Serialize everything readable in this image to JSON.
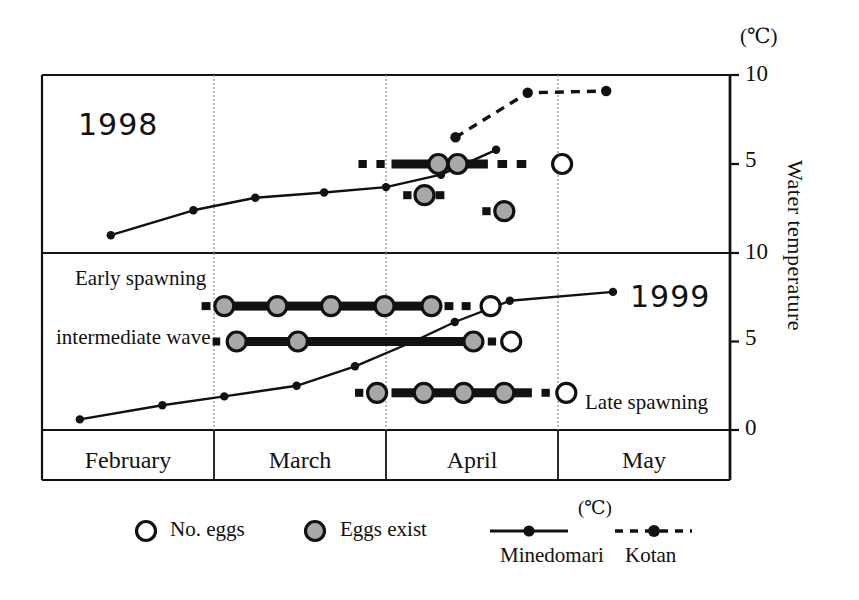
{
  "axis": {
    "unit_top": "(℃)",
    "title": "Water temperature",
    "top_panel_ticks": [
      "10",
      "5"
    ],
    "bottom_panel_ticks": [
      "10",
      "5",
      "0"
    ]
  },
  "panels": {
    "top_year": "1998",
    "bottom_year": "1999"
  },
  "annotations": {
    "early": "Early spawning",
    "intermediate": "intermediate wave",
    "late": "Late spawning"
  },
  "months": [
    "February",
    "March",
    "April",
    "May"
  ],
  "legend": {
    "no_eggs": "No. eggs",
    "eggs_exist": "Eggs exist",
    "minedomari": "Minedomari",
    "kotan": "Kotan",
    "unit": "(℃)"
  },
  "colors": {
    "ink": "#111111",
    "egg_fill": "#a8a8a8",
    "open_fill": "#ffffff",
    "grid": "#888888"
  },
  "chart_data": {
    "type": "line",
    "xlabel": "",
    "ylabel": "Water temperature",
    "x_categories": [
      "February",
      "March",
      "April",
      "May"
    ],
    "grid": true,
    "legend_position": "bottom",
    "panels": [
      {
        "name": "1998",
        "ylim": [
          0,
          10
        ],
        "yticks": [
          5,
          10
        ],
        "series": [
          {
            "name": "Minedomari",
            "style": "solid-line-filled-dot",
            "points": [
              {
                "date": "Feb 10",
                "x": 0.1,
                "temp": 1.0
              },
              {
                "date": "Feb 25",
                "x": 0.22,
                "temp": 2.4
              },
              {
                "date": "Mar 07",
                "x": 0.31,
                "temp": 3.1
              },
              {
                "date": "Mar 20",
                "x": 0.41,
                "temp": 3.4
              },
              {
                "date": "Mar 31",
                "x": 0.5,
                "temp": 3.7
              },
              {
                "date": "Apr 10",
                "x": 0.58,
                "temp": 4.4
              },
              {
                "date": "Apr 20",
                "x": 0.66,
                "temp": 5.8
              }
            ]
          },
          {
            "name": "Kotan",
            "style": "dashed-line-filled-dot",
            "points": [
              {
                "date": "Apr 15",
                "x": 0.601,
                "temp": 6.5
              },
              {
                "date": "Apr 27",
                "x": 0.706,
                "temp": 9.0
              },
              {
                "date": "May 10",
                "x": 0.82,
                "temp": 9.1
              }
            ]
          }
        ],
        "egg_records": [
          {
            "label": "main spawning 1998",
            "temp": 5.0,
            "segments": [
              {
                "from": 0.46,
                "to": 0.472,
                "type": "dash"
              },
              {
                "from": 0.486,
                "to": 0.498,
                "type": "dash"
              },
              {
                "from": 0.508,
                "to": 0.596,
                "type": "bar"
              },
              {
                "from": 0.604,
                "to": 0.648,
                "type": "bar"
              },
              {
                "from": 0.662,
                "to": 0.676,
                "type": "dash"
              },
              {
                "from": 0.69,
                "to": 0.704,
                "type": "dash"
              }
            ],
            "markers": [
              {
                "x": 0.576,
                "type": "eggs-exist"
              },
              {
                "x": 0.604,
                "type": "eggs-exist"
              },
              {
                "x": 0.756,
                "type": "no-eggs"
              }
            ]
          },
          {
            "label": "secondary record 1998",
            "temp": 3.25,
            "segments": [
              {
                "from": 0.525,
                "to": 0.537,
                "type": "dash"
              },
              {
                "from": 0.572,
                "to": 0.585,
                "type": "dash"
              }
            ],
            "markers": [
              {
                "x": 0.556,
                "type": "eggs-exist"
              }
            ]
          },
          {
            "label": "tertiary record 1998",
            "temp": 2.35,
            "segments": [
              {
                "from": 0.64,
                "to": 0.652,
                "type": "dash"
              }
            ],
            "markers": [
              {
                "x": 0.672,
                "type": "eggs-exist"
              }
            ]
          }
        ]
      },
      {
        "name": "1999",
        "ylim": [
          0,
          10
        ],
        "yticks": [
          0,
          5,
          10
        ],
        "series": [
          {
            "name": "Minedomari",
            "style": "solid-line-filled-dot",
            "points": [
              {
                "date": "Feb 08",
                "x": 0.055,
                "temp": 0.6
              },
              {
                "date": "Feb 22",
                "x": 0.175,
                "temp": 1.4
              },
              {
                "date": "Mar 06",
                "x": 0.265,
                "temp": 1.9
              },
              {
                "date": "Mar 20",
                "x": 0.37,
                "temp": 2.5
              },
              {
                "date": "Mar 31",
                "x": 0.455,
                "temp": 3.6
              },
              {
                "date": "Apr 10",
                "x": 0.54,
                "temp": 5.0
              },
              {
                "date": "Apr 18",
                "x": 0.6,
                "temp": 6.1
              },
              {
                "date": "Apr 27",
                "x": 0.68,
                "temp": 7.3
              },
              {
                "date": "May 12",
                "x": 0.83,
                "temp": 7.8
              }
            ]
          }
        ],
        "egg_records": [
          {
            "label": "Early spawning",
            "temp": 7.0,
            "segments": [
              {
                "from": 0.232,
                "to": 0.245,
                "type": "dash"
              },
              {
                "from": 0.258,
                "to": 0.572,
                "type": "bar"
              },
              {
                "from": 0.585,
                "to": 0.598,
                "type": "dash"
              },
              {
                "from": 0.61,
                "to": 0.623,
                "type": "dash"
              }
            ],
            "markers": [
              {
                "x": 0.265,
                "type": "eggs-exist"
              },
              {
                "x": 0.342,
                "type": "eggs-exist"
              },
              {
                "x": 0.42,
                "type": "eggs-exist"
              },
              {
                "x": 0.498,
                "type": "eggs-exist"
              },
              {
                "x": 0.566,
                "type": "eggs-exist"
              },
              {
                "x": 0.652,
                "type": "no-eggs"
              }
            ]
          },
          {
            "label": "intermediate wave",
            "temp": 5.0,
            "segments": [
              {
                "from": 0.248,
                "to": 0.259,
                "type": "dash"
              },
              {
                "from": 0.272,
                "to": 0.612,
                "type": "bar"
              },
              {
                "from": 0.648,
                "to": 0.66,
                "type": "dash"
              }
            ],
            "markers": [
              {
                "x": 0.283,
                "type": "eggs-exist"
              },
              {
                "x": 0.372,
                "type": "eggs-exist"
              },
              {
                "x": 0.627,
                "type": "eggs-exist"
              },
              {
                "x": 0.682,
                "type": "no-eggs"
              }
            ]
          },
          {
            "label": "Late spawning",
            "temp": 2.1,
            "segments": [
              {
                "from": 0.455,
                "to": 0.467,
                "type": "dash"
              },
              {
                "from": 0.508,
                "to": 0.712,
                "type": "bar"
              },
              {
                "from": 0.726,
                "to": 0.738,
                "type": "dash"
              }
            ],
            "markers": [
              {
                "x": 0.487,
                "type": "eggs-exist"
              },
              {
                "x": 0.555,
                "type": "eggs-exist"
              },
              {
                "x": 0.613,
                "type": "eggs-exist"
              },
              {
                "x": 0.672,
                "type": "eggs-exist"
              },
              {
                "x": 0.762,
                "type": "no-eggs"
              }
            ]
          }
        ]
      }
    ]
  }
}
